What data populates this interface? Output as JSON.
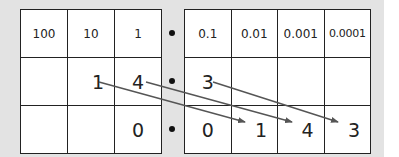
{
  "diagram": {
    "title": "",
    "colors": {
      "background": "#e3e3e3",
      "grid_line": "#222222",
      "arrow": "#555555"
    },
    "headers_left": [
      "100",
      "10",
      "1"
    ],
    "headers_right": [
      "0.1",
      "0.01",
      "0.001",
      "0.0001"
    ],
    "decimal_point": "•",
    "rows": [
      {
        "left": [
          "",
          "1",
          "4"
        ],
        "right": [
          "3",
          "",
          "",
          ""
        ]
      },
      {
        "left": [
          "",
          "",
          "0"
        ],
        "right": [
          "0",
          "1",
          "4",
          "3"
        ]
      }
    ],
    "arrows": [
      {
        "from": "1 (tens)",
        "to": "1 (hundredths)"
      },
      {
        "from": "4 (ones)",
        "to": "4 (thousandths)"
      },
      {
        "from": "3 (tenths)",
        "to": "3 (ten-thousandths)"
      }
    ]
  }
}
